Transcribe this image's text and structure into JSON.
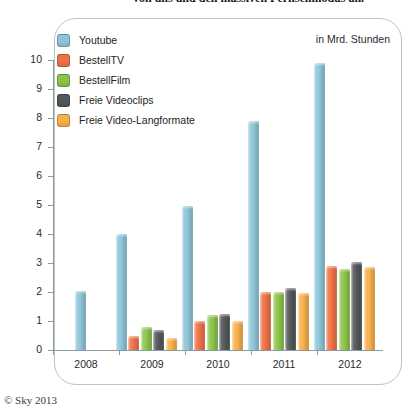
{
  "page": {
    "top_cut_caption": "von uns und den massiven Fernsehmodus an.",
    "footer_credit": "© Sky 2013"
  },
  "chart_data": {
    "type": "bar",
    "title": "",
    "subtitle": "",
    "unit_label": "in Mrd. Stunden",
    "xlabel": "",
    "ylabel": "",
    "ylim": [
      0,
      10
    ],
    "ytick_labels": [
      "0",
      "1",
      "2",
      "3",
      "4",
      "5",
      "6",
      "7",
      "8",
      "9",
      "10"
    ],
    "ytick_values": [
      0,
      1,
      2,
      3,
      4,
      5,
      6,
      7,
      8,
      9,
      10
    ],
    "grid": false,
    "legend_position": "top-left",
    "categories": [
      "2008",
      "2009",
      "2010",
      "2011",
      "2012"
    ],
    "series": [
      {
        "name": "Youtube",
        "color": "#8ec6d8",
        "values": [
          2.05,
          4.0,
          4.95,
          7.9,
          9.9
        ]
      },
      {
        "name": "BestellTV",
        "color": "#ef7246",
        "values": [
          0,
          0.5,
          1.0,
          2.0,
          2.9
        ]
      },
      {
        "name": "BestellFilm",
        "color": "#8cc44a",
        "values": [
          0,
          0.8,
          1.2,
          2.0,
          2.8
        ]
      },
      {
        "name": "Freie Videoclips",
        "color": "#55585a",
        "values": [
          0,
          0.7,
          1.25,
          2.15,
          3.05
        ]
      },
      {
        "name": "Freie Video-Langformate",
        "color": "#f8b04b",
        "values": [
          0,
          0.4,
          1.0,
          1.95,
          2.85
        ]
      }
    ]
  }
}
